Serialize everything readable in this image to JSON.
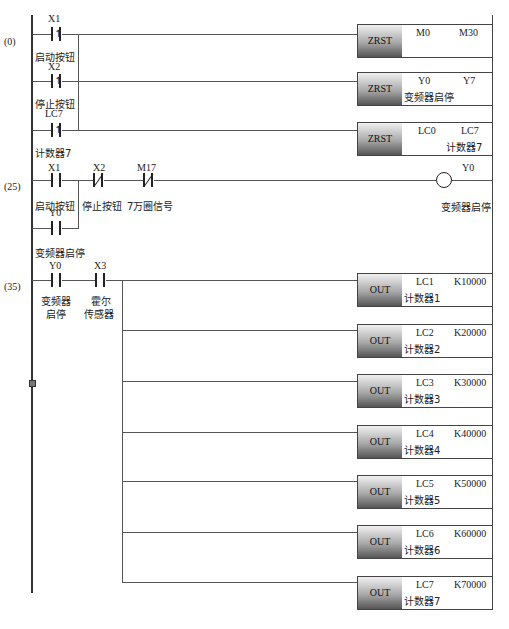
{
  "diagram": {
    "type": "PLC ladder diagram",
    "rungs": [
      {
        "step": "(0)",
        "contacts": [
          {
            "addr": "X1",
            "type": "rising-edge",
            "comment": "启动按钮"
          },
          {
            "addr": "X2",
            "type": "rising-edge",
            "comment": "停止按钮"
          },
          {
            "addr": "LC7",
            "type": "rising-edge",
            "comment": "计数器7"
          }
        ],
        "outputs": [
          {
            "op": "ZRST",
            "p1": "M0",
            "p2": "M30",
            "comment": ""
          },
          {
            "op": "ZRST",
            "p1": "Y0",
            "p2": "Y7",
            "comment": "变频器启停"
          },
          {
            "op": "ZRST",
            "p1": "LC0",
            "p2": "LC7",
            "comment": "计数器7"
          }
        ]
      },
      {
        "step": "(25)",
        "contacts": [
          {
            "addr": "X1",
            "type": "NO",
            "comment": "启动按钮"
          },
          {
            "addr": "X2",
            "type": "NC",
            "comment": "停止按钮"
          },
          {
            "addr": "M17",
            "type": "NC",
            "comment": "7万圈信号"
          },
          {
            "addr": "Y0",
            "type": "NO",
            "comment": "变频器启停"
          }
        ],
        "coil": {
          "addr": "Y0",
          "comment": "变频器启停"
        }
      },
      {
        "step": "(35)",
        "contacts": [
          {
            "addr": "Y0",
            "type": "NO",
            "comment1": "变频器",
            "comment2": "启停"
          },
          {
            "addr": "X3",
            "type": "NO",
            "comment1": "霍尔",
            "comment2": "传感器"
          }
        ],
        "outputs": [
          {
            "op": "OUT",
            "p1": "LC1",
            "p2": "K10000",
            "comment": "计数器1"
          },
          {
            "op": "OUT",
            "p1": "LC2",
            "p2": "K20000",
            "comment": "计数器2"
          },
          {
            "op": "OUT",
            "p1": "LC3",
            "p2": "K30000",
            "comment": "计数器3"
          },
          {
            "op": "OUT",
            "p1": "LC4",
            "p2": "K40000",
            "comment": "计数器4"
          },
          {
            "op": "OUT",
            "p1": "LC5",
            "p2": "K50000",
            "comment": "计数器5"
          },
          {
            "op": "OUT",
            "p1": "LC6",
            "p2": "K60000",
            "comment": "计数器6"
          },
          {
            "op": "OUT",
            "p1": "LC7",
            "p2": "K70000",
            "comment": "计数器7"
          }
        ]
      }
    ]
  }
}
